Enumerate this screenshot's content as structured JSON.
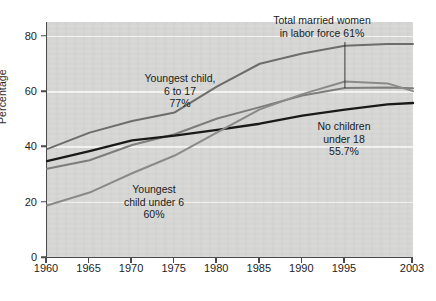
{
  "chart_data": {
    "type": "line",
    "title": "",
    "subtitle": "",
    "xlabel": "",
    "ylabel": "Percentage",
    "xlim": [
      1960,
      2003
    ],
    "ylim": [
      0,
      85
    ],
    "grid": true,
    "legend_position": "inline-annotations",
    "x_ticks": [
      "1960",
      "1965",
      "1970",
      "1975",
      "1980",
      "1985",
      "1990",
      "1995",
      "2003"
    ],
    "x_tick_values": [
      1960,
      1965,
      1970,
      1975,
      1980,
      1985,
      1990,
      1995,
      2003
    ],
    "y_ticks": [
      "0",
      "20",
      "40",
      "60",
      "80"
    ],
    "y_tick_values": [
      0,
      20,
      40,
      60,
      80
    ],
    "x": [
      1960,
      1965,
      1970,
      1975,
      1980,
      1985,
      1990,
      1995,
      2000,
      2003
    ],
    "series": [
      {
        "name": "Youngest child, 6 to 17",
        "end_value_label": "77%",
        "color": "#6d6d6d",
        "values": [
          39,
          45,
          49.2,
          52.3,
          61.7,
          69.9,
          73.6,
          76.4,
          77,
          77
        ]
      },
      {
        "name": "Total married women in labor force",
        "end_value_label": "61%",
        "color": "#7d7d7d",
        "values": [
          31.9,
          35,
          40.5,
          44.4,
          50.1,
          54.2,
          58.4,
          61.1,
          61.3,
          61
        ]
      },
      {
        "name": "No children under 18",
        "end_value_label": "55.7%",
        "color": "#1a1a1a",
        "values": [
          34.7,
          38.3,
          42.2,
          43.9,
          46,
          48.2,
          51.1,
          53.3,
          55.2,
          55.7
        ]
      },
      {
        "name": "Youngest child under 6",
        "end_value_label": "60%",
        "color": "#8a8a8a",
        "values": [
          18.6,
          23.3,
          30.3,
          36.7,
          45.1,
          53.4,
          58.9,
          63.5,
          62.8,
          60
        ]
      }
    ],
    "annotations": [
      {
        "id": "youngest-child-6-to-17",
        "text": "Youngest child,\n6 to 17\n77%",
        "x_px": 180,
        "y_px": 72
      },
      {
        "id": "total-married-women",
        "text": "Total married women\nin labor force 61%",
        "x_px": 322,
        "y_px": 14
      },
      {
        "id": "no-children-under-18",
        "text": "No children\nunder 18\n55.7%",
        "x_px": 344,
        "y_px": 120
      },
      {
        "id": "youngest-child-under-6",
        "text": "Youngest\nchild under 6\n60%",
        "x_px": 154,
        "y_px": 183
      }
    ]
  }
}
